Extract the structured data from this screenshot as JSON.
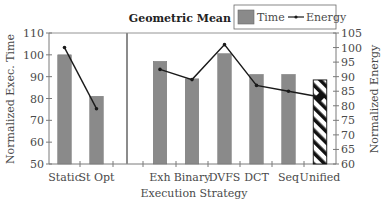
{
  "chart_data": {
    "type": "bar",
    "title": "Geometric Mean",
    "xlabel": "Execution Strategy",
    "ylabel": "Normalized Exec. Time",
    "y2label": "Normalized Energy",
    "ylim": [
      50,
      110
    ],
    "y2lim": [
      60,
      105
    ],
    "yticks": [
      50,
      60,
      70,
      80,
      90,
      100,
      110
    ],
    "y2ticks": [
      60,
      65,
      70,
      75,
      80,
      85,
      90,
      95,
      100,
      105
    ],
    "grid": false,
    "legend_position": "top-right",
    "groups": [
      {
        "name": "baseline",
        "categories": [
          "Static",
          "St Opt"
        ]
      },
      {
        "name": "strategies",
        "categories": [
          "Exh",
          "Binary",
          "DVFS",
          "DCT",
          "Seq",
          "Unified"
        ]
      }
    ],
    "categories": [
      "Static",
      "St Opt",
      "Exh",
      "Binary",
      "DVFS",
      "DCT",
      "Seq",
      "Unified"
    ],
    "series": [
      {
        "name": "Time",
        "type": "bar",
        "axis": "left",
        "color": "#8a8a8a",
        "values": [
          100,
          81,
          97,
          89,
          100.5,
          91,
          91,
          88.5
        ]
      },
      {
        "name": "Energy",
        "type": "line",
        "axis": "right",
        "color": "#1a1a1a",
        "values": [
          100,
          79,
          92.5,
          89,
          101,
          87,
          85,
          83
        ]
      }
    ],
    "highlight": {
      "category": "Unified",
      "style": "hatched"
    }
  },
  "legend": {
    "title": "Geometric Mean",
    "items": [
      {
        "label": "Time",
        "symbol": "bar"
      },
      {
        "label": "Energy",
        "symbol": "line-marker"
      }
    ]
  },
  "colors": {
    "bar": "#8a8a8a",
    "bar_stroke": "#6e6e6e",
    "line": "#1a1a1a",
    "axis": "#7a7a7a",
    "divider": "#8c8c8c",
    "text": "#4a4a4a"
  }
}
